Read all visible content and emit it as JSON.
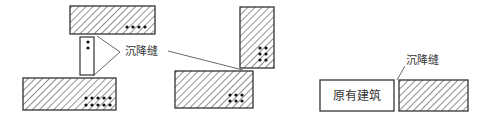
{
  "diagram": {
    "type": "settlement-joint-layout",
    "colors": {
      "stroke": "#333333",
      "hatch": "#555555",
      "background": "#ffffff"
    },
    "labels": {
      "joint_left": "沉降缝",
      "joint_right": "沉降缝",
      "existing_building": "原有建筑"
    },
    "figures": [
      {
        "name": "figure-left",
        "blocks": [
          {
            "name": "top-block",
            "x": 70,
            "y": 6,
            "w": 85,
            "h": 28,
            "hatched": true,
            "dots": {
              "rows": 1,
              "cols": 4
            }
          },
          {
            "name": "connector-block",
            "x": 80,
            "y": 37,
            "w": 14,
            "h": 38,
            "hatched": false,
            "dots": {
              "rows": 2,
              "cols": 1
            }
          },
          {
            "name": "bottom-block",
            "x": 23,
            "y": 78,
            "w": 93,
            "h": 32,
            "hatched": true,
            "dots": {
              "rows": 2,
              "cols": 5
            }
          }
        ]
      },
      {
        "name": "figure-middle",
        "blocks": [
          {
            "name": "tall-block",
            "x": 240,
            "y": 7,
            "w": 34,
            "h": 61,
            "hatched": true,
            "dots": {
              "rows": 3,
              "cols": 2
            }
          },
          {
            "name": "wide-block",
            "x": 175,
            "y": 71,
            "w": 78,
            "h": 37,
            "hatched": true,
            "dots": {
              "rows": 2,
              "cols": 3
            }
          }
        ]
      },
      {
        "name": "figure-right",
        "blocks": [
          {
            "name": "existing-building-block",
            "x": 320,
            "y": 80,
            "w": 74,
            "h": 31,
            "hatched": false
          },
          {
            "name": "new-building-block",
            "x": 399,
            "y": 80,
            "w": 69,
            "h": 31,
            "hatched": true
          }
        ]
      }
    ]
  }
}
